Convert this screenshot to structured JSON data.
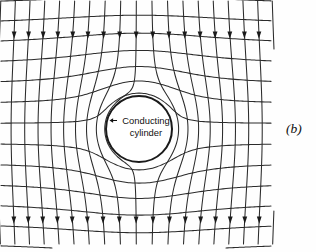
{
  "figure": {
    "type": "field-map-diagram",
    "panel_label": "(b)",
    "background_color": "#fefefe",
    "line_color": "#2b2b2b",
    "text_color": "#111111",
    "cylinder": {
      "label_line_1": "Conducting",
      "label_line_2": "cylinder",
      "center_x": 139,
      "center_y": 129,
      "radius": 33,
      "stroke_width": 2.0,
      "fill": "#ffffff"
    },
    "leader": {
      "icon": "arrow-left-icon",
      "tip_x": 109.5,
      "tip_y": 120.5,
      "tail_x": 117,
      "tail_y": 120.5
    },
    "field_region": {
      "left": 1,
      "right": 272,
      "top": 1,
      "bottom": 246
    },
    "field": {
      "uniform_direction": "downward",
      "equipotential_count": 13,
      "fieldline_count": 19,
      "arrow_rows_y": [
        33,
        218
      ],
      "arrow_size": 4.6
    }
  },
  "chart_data": {
    "type": "line",
    "xlabel": "",
    "ylabel": "",
    "annotations": [
      "Conducting cylinder",
      "(b)"
    ],
    "series": [
      {
        "name": "field lines (streamlines)",
        "description": "vertical lines deflected around cylinder, 19 lines, arrows point downward"
      },
      {
        "name": "equipotentials",
        "description": "horizontal curves bending around cylinder, 13 curves"
      }
    ],
    "grid": true,
    "legend_position": "none"
  }
}
